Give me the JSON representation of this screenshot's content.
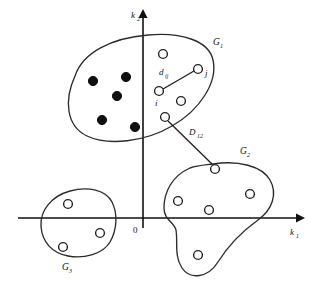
{
  "figure": {
    "background_color": "#ffffff",
    "line_color": "#222222",
    "filled_marker_color": "#101010",
    "open_marker_fill": "#ffffff"
  },
  "axes": {
    "x_label": "k",
    "x_label_sub": "1",
    "y_label": "k",
    "y_label_sub": "2",
    "origin_label": "0",
    "x_axis_y": 218,
    "y_axis_x": 143,
    "x_range_px": [
      18,
      300
    ],
    "y_range_px": [
      12,
      228
    ],
    "has_arrows": true,
    "has_grid": false,
    "has_ticks": false
  },
  "clusters": [
    {
      "id": "G1",
      "label": "G",
      "label_sub": "1",
      "label_x": 213,
      "label_y": 45,
      "shape": "tilted-ellipse",
      "filled_count": 5,
      "open_count": 5,
      "outline_path": "M 75 76 C 83 52, 112 38, 148 35 C 182 32, 209 41, 213 60 C 218 82, 200 110, 172 126 C 145 142, 108 146, 87 136 C 66 126, 64 100, 75 76 Z",
      "filled_points": [
        {
          "cx": 93,
          "cy": 81,
          "r": 4.6
        },
        {
          "cx": 126,
          "cy": 77,
          "r": 4.6
        },
        {
          "cx": 117,
          "cy": 96,
          "r": 4.6
        },
        {
          "cx": 102,
          "cy": 120,
          "r": 4.6
        },
        {
          "cx": 135,
          "cy": 127,
          "r": 4.6
        }
      ],
      "open_points": [
        {
          "id": "g1-top",
          "cx": 163,
          "cy": 54,
          "r": 4.4,
          "label": ""
        },
        {
          "id": "j",
          "cx": 198,
          "cy": 69,
          "r": 4.4,
          "label": "j"
        },
        {
          "id": "i",
          "cx": 159,
          "cy": 91,
          "r": 4.4,
          "label": "i"
        },
        {
          "id": "g1-mid",
          "cx": 181,
          "cy": 101,
          "r": 4.4,
          "label": ""
        },
        {
          "id": "g1-low",
          "cx": 165,
          "cy": 117,
          "r": 4.4,
          "label": ""
        }
      ]
    },
    {
      "id": "G2",
      "label": "G",
      "label_sub": "2",
      "label_x": 240,
      "label_y": 154,
      "shape": "irregular-blob",
      "filled_count": 0,
      "open_count": 5,
      "outline_path": "M 213 164 C 238 160, 262 166, 270 180 C 278 194, 272 210, 258 220 C 244 230, 228 246, 218 262 C 208 278, 190 280, 182 268 C 174 256, 178 242, 176 230 C 174 222, 164 220, 164 208 C 164 192, 172 176, 190 168 C 198 165, 205 165, 213 164 Z",
      "filled_points": [],
      "open_points": [
        {
          "id": "g2-top",
          "cx": 215,
          "cy": 169,
          "r": 4.4,
          "label": ""
        },
        {
          "id": "g2-right",
          "cx": 250,
          "cy": 194,
          "r": 4.4,
          "label": ""
        },
        {
          "id": "g2-left",
          "cx": 178,
          "cy": 201,
          "r": 4.4,
          "label": ""
        },
        {
          "id": "g2-center",
          "cx": 209,
          "cy": 210,
          "r": 4.4,
          "label": ""
        },
        {
          "id": "g2-bottom",
          "cx": 198,
          "cy": 255,
          "r": 4.4,
          "label": ""
        }
      ]
    },
    {
      "id": "G3",
      "label": "G",
      "label_sub": "3",
      "label_x": 62,
      "label_y": 270,
      "shape": "rounded-blob",
      "filled_count": 0,
      "open_count": 3,
      "outline_path": "M 70 191 C 88 186, 106 190, 112 202 C 118 214, 117 230, 110 242 C 103 254, 84 259, 68 256 C 52 253, 42 242, 41 226 C 40 210, 52 196, 70 191 Z",
      "filled_points": [],
      "open_points": [
        {
          "id": "g3-top",
          "cx": 68,
          "cy": 204,
          "r": 4.4,
          "label": ""
        },
        {
          "id": "g3-right",
          "cx": 100,
          "cy": 233,
          "r": 4.4,
          "label": ""
        },
        {
          "id": "g3-bottom",
          "cx": 63,
          "cy": 247,
          "r": 4.4,
          "label": ""
        }
      ]
    }
  ],
  "distances": [
    {
      "id": "d-ij",
      "label": "d",
      "label_sub": "ij",
      "label_x": 159,
      "label_y": 75,
      "kind": "intra-cluster",
      "from": {
        "x": 163,
        "y": 89
      },
      "to": {
        "x": 194,
        "y": 71
      }
    },
    {
      "id": "D-12",
      "label": "D",
      "label_sub": "12",
      "label_x": 189,
      "label_y": 135,
      "kind": "inter-cluster",
      "from": {
        "x": 168,
        "y": 121
      },
      "to": {
        "x": 213,
        "y": 165
      }
    }
  ]
}
